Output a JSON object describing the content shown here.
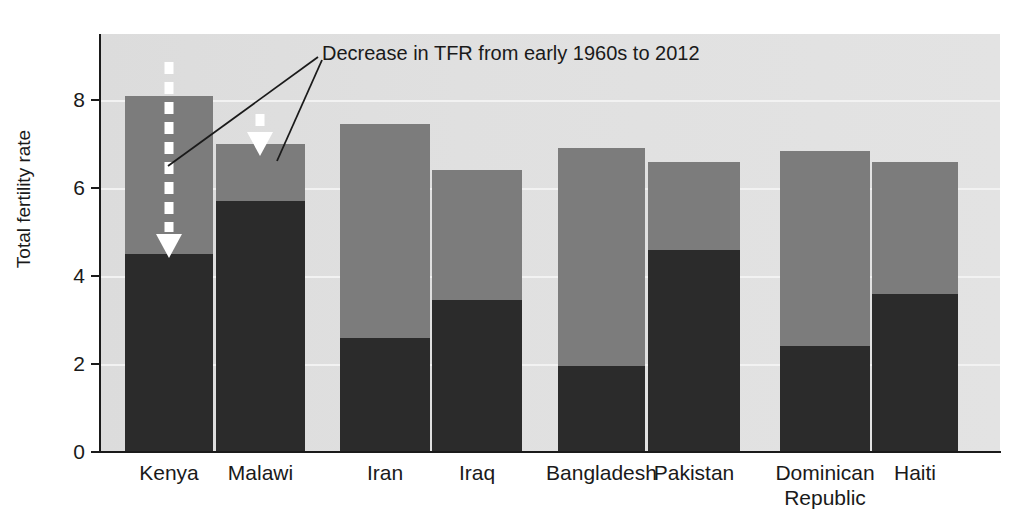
{
  "chart_data": {
    "type": "bar",
    "subtype": "stacked-bar",
    "title": "",
    "xlabel": "",
    "ylabel": "Total fertility rate",
    "ylim": [
      0,
      9.4
    ],
    "yticks": [
      0,
      2,
      4,
      6,
      8
    ],
    "ytick_labels": [
      "0",
      "2",
      "4",
      "6",
      "8"
    ],
    "grid": true,
    "grid_orientation": "horizontal",
    "legend": "none",
    "categories": [
      "Kenya",
      "Malawi",
      "Iran",
      "Iraq",
      "Bangladesh",
      "Pakistan",
      "Dominican Republic",
      "Haiti"
    ],
    "series": [
      {
        "name": "Total fertility rate, 2012",
        "color": "#2b2b2b",
        "values": [
          4.5,
          5.7,
          2.6,
          3.45,
          1.95,
          4.6,
          2.4,
          3.6
        ]
      },
      {
        "name": "Total fertility rate, early 1960s",
        "color": "#7c7c7c",
        "values": [
          8.1,
          7.0,
          7.45,
          6.4,
          6.9,
          6.6,
          6.85,
          6.6
        ]
      }
    ],
    "annotations": [
      {
        "text": "Decrease in TFR from early 1960s to 2012",
        "points_to": [
          "Kenya",
          "Malawi"
        ]
      }
    ]
  },
  "axis": {
    "y_label": "Total fertility rate",
    "ticks": [
      {
        "value": "8"
      },
      {
        "value": "6"
      },
      {
        "value": "4"
      },
      {
        "value": "2"
      },
      {
        "value": "0"
      }
    ]
  },
  "bars": [
    {
      "name": "Kenya",
      "label": "Kenya",
      "label_line2": "",
      "past": 8.1,
      "current": 4.5
    },
    {
      "name": "Malawi",
      "label": "Malawi",
      "label_line2": "",
      "past": 7.0,
      "current": 5.7
    },
    {
      "name": "Iran",
      "label": "Iran",
      "label_line2": "",
      "past": 7.45,
      "current": 2.6
    },
    {
      "name": "Iraq",
      "label": "Iraq",
      "label_line2": "",
      "past": 6.4,
      "current": 3.45
    },
    {
      "name": "Bangladesh",
      "label": "Bangladesh",
      "label_line2": "",
      "past": 6.9,
      "current": 1.95
    },
    {
      "name": "Pakistan",
      "label": "Pakistan",
      "label_line2": "",
      "past": 6.6,
      "current": 4.6
    },
    {
      "name": "Dominican Republic",
      "label": "Dominican",
      "label_line2": "Republic",
      "past": 6.85,
      "current": 2.4
    },
    {
      "name": "Haiti",
      "label": "Haiti",
      "label_line2": "",
      "past": 6.6,
      "current": 3.6
    }
  ],
  "annotation": {
    "text": "Decrease in TFR from early 1960s to 2012"
  },
  "colors": {
    "past_bar": "#7c7c7c",
    "current_bar": "#2b2b2b",
    "plot_background": "#dedede",
    "gridline": "#f2f2f2",
    "axis": "#1a1a1a",
    "arrow": "#ffffff"
  }
}
